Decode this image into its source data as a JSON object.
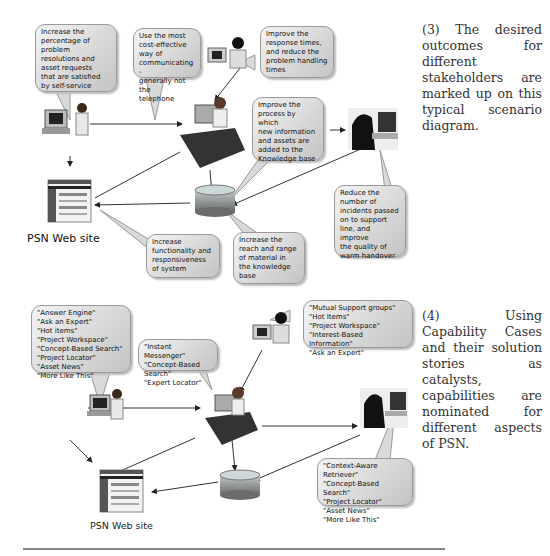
{
  "diagram1": {
    "caption": "(3) The desired outcomes for different stakeholders are marked up on this typical scenario diagram.",
    "web_site_label": "PSN Web site",
    "bubbles": [
      {
        "id": "self-service",
        "text": "Increase the\npercentage of\nproblem\nresolutions and\nasset requests\nthat are satisfied\nby self-service"
      },
      {
        "id": "cost-effective",
        "text": "Use the most\ncost-effective\nway of\ncommunicating -\ngenerally not the\ntelephone"
      },
      {
        "id": "response-times",
        "text": "Improve the\nresponse times,\nand reduce the\nproblem handling\ntimes"
      },
      {
        "id": "knowledge-process",
        "text": "Improve the\nprocess by which\nnew information\nand assets are\nadded to the\nKnowledge base"
      },
      {
        "id": "reduce-incidents",
        "text": "Reduce the\nnumber of\nincidents passed\non to support\nline, and improve\nthe quality of\nwarm handover"
      },
      {
        "id": "functionality",
        "text": "Increase\nfunctionality and\nresponsiveness\nof system"
      },
      {
        "id": "reach-range",
        "text": "Increase the\nreach and range\nof material in\nthe knowledge\nbase"
      }
    ]
  },
  "diagram2": {
    "caption": "(4) Using Capability Cases and their solution stories as catalysts, capabilities are nominated for different aspects of PSN.",
    "web_site_label": "PSN Web site",
    "bubbles": [
      {
        "id": "end-user",
        "text": "\"Answer Engine\"\n\"Ask an Expert\"\n\"Hot items\"\n\"Project Workspace\"\n\"Concept-Based Search\"\n\"Project Locator\"\n\"Asset News\"\n\"More Like This\""
      },
      {
        "id": "service-desk",
        "text": "\"Instant Messenger\"\n\"Concept-Based Search\"\n\"Expert Locator\""
      },
      {
        "id": "support-team",
        "text": "\"Mutual Support groups\"\n\"Hot Items\"\n\"Project Workspace\"\n\"Interest-Based Information\"\n\"Ask an Expert\""
      },
      {
        "id": "specialist",
        "text": "\"Context-Aware Retriever\"\n\"Concept-Based Search\"\n\"Project Locator\"\n\"Asset News\"\n\"More Like This\""
      }
    ]
  },
  "icons": {
    "user": "person-at-computer-icon",
    "agent": "help-desk-agent-icon",
    "support": "support-person-icon",
    "specialist": "specialist-at-desk-icon",
    "database": "knowledge-base-cylinder-icon",
    "website": "web-page-thumbnail-icon"
  }
}
